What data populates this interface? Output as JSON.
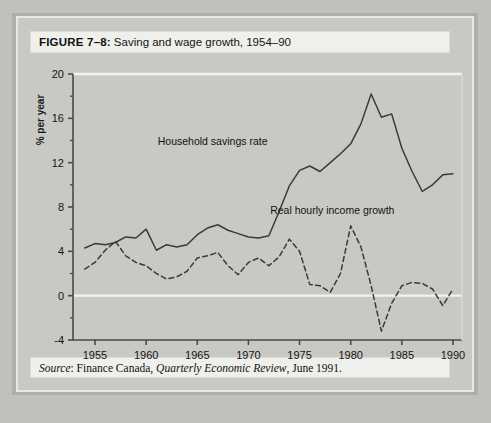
{
  "figure": {
    "label_prefix": "FIGURE 7–8:",
    "title": "Saving and wage growth, 1954–90",
    "source_prefix": "Source",
    "source_sep": ": ",
    "source_org": "Finance Canada, ",
    "source_publication": "Quarterly Economic Review",
    "source_date": ", June 1991."
  },
  "colors": {
    "page_background": "#c0c0bc",
    "figure_background": "#c8c8c4",
    "plot_background": "#c8c8c4",
    "title_box": "#efefeb",
    "line": "#3a3a3a",
    "gridline": "#f2f2ee",
    "axis": "#4a4a4a"
  },
  "chart_data": {
    "type": "line",
    "title": "Saving and wage growth, 1954–90",
    "xlabel": "",
    "ylabel": "% per year",
    "xlim": [
      1954,
      1990
    ],
    "ylim": [
      -4,
      20
    ],
    "yticks": [
      -4,
      0,
      4,
      8,
      12,
      16,
      20
    ],
    "yticklabels": [
      "-4",
      "0",
      "4",
      "8",
      "12",
      "16",
      "20"
    ],
    "y_minor_ticks": [
      -2,
      2,
      6,
      10,
      14,
      18
    ],
    "xticks": [
      1955,
      1960,
      1965,
      1970,
      1975,
      1980,
      1985,
      1990
    ],
    "xticklabels": [
      "1955",
      "1960",
      "1965",
      "1970",
      "1975",
      "1980",
      "1985",
      "1990"
    ],
    "grid": false,
    "gridlines_y": [
      0,
      20
    ],
    "legend": "inline-annotations",
    "x": [
      1954,
      1955,
      1956,
      1957,
      1958,
      1959,
      1960,
      1961,
      1962,
      1963,
      1964,
      1965,
      1966,
      1967,
      1968,
      1969,
      1970,
      1971,
      1972,
      1973,
      1974,
      1975,
      1976,
      1977,
      1978,
      1979,
      1980,
      1981,
      1982,
      1983,
      1984,
      1985,
      1986,
      1987,
      1988,
      1989,
      1990
    ],
    "series": [
      {
        "name": "Household savings rate",
        "style": "solid",
        "label_x": 1966.5,
        "label_y": 13.6,
        "values": [
          4.3,
          4.7,
          4.6,
          4.8,
          5.3,
          5.2,
          6.0,
          4.1,
          4.6,
          4.4,
          4.6,
          5.5,
          6.1,
          6.4,
          5.9,
          5.6,
          5.3,
          5.2,
          5.4,
          7.6,
          9.9,
          11.3,
          11.7,
          11.2,
          12.0,
          12.8,
          13.7,
          15.5,
          18.2,
          16.1,
          16.4,
          13.3,
          11.2,
          9.4,
          10.0,
          10.9,
          11.0
        ]
      },
      {
        "name": "Real hourly income growth",
        "style": "dashed",
        "label_x": 1978.2,
        "label_y": 7.4,
        "values": [
          2.4,
          3.0,
          4.1,
          4.9,
          3.6,
          3.0,
          2.7,
          2.0,
          1.5,
          1.7,
          2.2,
          3.4,
          3.6,
          3.9,
          2.7,
          1.9,
          3.0,
          3.4,
          2.7,
          3.5,
          5.1,
          4.0,
          1.0,
          0.9,
          0.3,
          2.0,
          6.3,
          4.4,
          0.9,
          -3.2,
          -0.7,
          0.9,
          1.2,
          1.1,
          0.6,
          -0.9,
          0.6
        ]
      }
    ],
    "series_b_override_note": ""
  }
}
